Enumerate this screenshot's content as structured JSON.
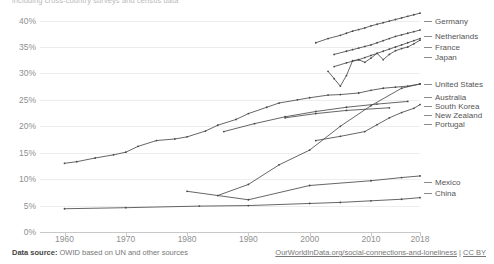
{
  "subtitle_fragment": "including cross-country surveys and census data",
  "footer": {
    "source_label": "Data source:",
    "source_text": " OWID based on UN and other sources",
    "credit_url": "OurWorldInData.org/social-connections-and-loneliness",
    "credit_license": "CC BY",
    "credit_separator": " | "
  },
  "chart_data": {
    "type": "line",
    "title": "",
    "xlabel": "",
    "ylabel": "",
    "xlim": [
      1956,
      2018
    ],
    "ylim": [
      0,
      42
    ],
    "grid": true,
    "legend_position": "right",
    "ytick_labels": [
      "0%",
      "5%",
      "10%",
      "15%",
      "20%",
      "25%",
      "30%",
      "35%",
      "40%"
    ],
    "ytick_values": [
      0,
      5,
      10,
      15,
      20,
      25,
      30,
      35,
      40
    ],
    "xtick_labels": [
      "1960",
      "1970",
      "1980",
      "1990",
      "2000",
      "2010",
      "2018"
    ],
    "xtick_values": [
      1960,
      1970,
      1980,
      1990,
      2000,
      2010,
      2018
    ],
    "series": [
      {
        "name": "Germany",
        "label_y": 17,
        "x": [
          2001,
          2003,
          2005,
          2006,
          2007,
          2008,
          2009,
          2010,
          2011,
          2012,
          2013,
          2014,
          2015,
          2016,
          2017,
          2018
        ],
        "values": [
          35.8,
          36.6,
          37.2,
          37.6,
          38.0,
          38.3,
          38.6,
          39.0,
          39.3,
          39.6,
          39.9,
          40.2,
          40.5,
          40.8,
          41.1,
          41.4
        ]
      },
      {
        "name": "Netherlands",
        "label_y": 32,
        "x": [
          2004,
          2006,
          2007,
          2008,
          2009,
          2010,
          2011,
          2012,
          2013,
          2014,
          2015,
          2016,
          2017,
          2018
        ],
        "values": [
          33.6,
          34.2,
          34.5,
          34.8,
          35.1,
          35.4,
          35.8,
          36.2,
          36.6,
          37.0,
          37.3,
          37.6,
          37.9,
          38.2
        ]
      },
      {
        "name": "France",
        "label_y": 43,
        "x": [
          2004,
          2006,
          2008,
          2009,
          2010,
          2011,
          2012,
          2013,
          2014,
          2015,
          2016,
          2017,
          2018
        ],
        "values": [
          31.3,
          32.0,
          32.6,
          33.0,
          33.4,
          33.8,
          34.2,
          34.6,
          35.0,
          35.4,
          35.8,
          36.2,
          36.6
        ]
      },
      {
        "name": "Japan",
        "label_y": 53,
        "x": [
          2003,
          2004,
          2005,
          2006,
          2007,
          2008,
          2009,
          2010,
          2011,
          2012,
          2013,
          2014,
          2015,
          2016,
          2017,
          2018
        ],
        "values": [
          30.4,
          29.0,
          27.6,
          29.6,
          32.4,
          32.6,
          32.1,
          32.9,
          33.8,
          32.6,
          33.6,
          34.3,
          34.7,
          35.0,
          35.6,
          36.3
        ]
      },
      {
        "name": "United States",
        "label_y": 80,
        "x": [
          1960,
          1962,
          1965,
          1968,
          1970,
          1972,
          1975,
          1978,
          1980,
          1983,
          1985,
          1988,
          1990,
          1993,
          1995,
          1998,
          2000,
          2003,
          2005,
          2008,
          2010,
          2012,
          2014,
          2016,
          2018
        ],
        "values": [
          13.0,
          13.3,
          14.0,
          14.6,
          15.1,
          16.2,
          17.3,
          17.6,
          18.0,
          19.1,
          20.2,
          21.3,
          22.4,
          23.6,
          24.4,
          25.0,
          25.4,
          25.9,
          26.0,
          26.3,
          26.8,
          27.2,
          27.4,
          27.6,
          28.0
        ]
      },
      {
        "name": "Australia",
        "label_y": 93,
        "x": [
          1986,
          1991,
          1996,
          2001,
          2006,
          2011,
          2016
        ],
        "values": [
          19.0,
          20.5,
          21.8,
          22.8,
          23.6,
          24.2,
          24.7
        ]
      },
      {
        "name": "South Korea",
        "label_y": 102,
        "x": [
          1985,
          1990,
          1995,
          2000,
          2005,
          2010,
          2015,
          2018
        ],
        "values": [
          6.9,
          9.0,
          12.7,
          15.5,
          20.0,
          23.9,
          27.2,
          28.0
        ]
      },
      {
        "name": "New Zealand",
        "label_y": 111,
        "x": [
          1996,
          2001,
          2006,
          2013
        ],
        "values": [
          21.6,
          22.4,
          23.0,
          23.5
        ]
      },
      {
        "name": "Portugal",
        "label_y": 120,
        "x": [
          2001,
          2005,
          2009,
          2011,
          2013,
          2015,
          2017,
          2018
        ],
        "values": [
          17.3,
          18.1,
          19.0,
          20.3,
          21.6,
          22.6,
          23.4,
          24.1
        ]
      },
      {
        "name": "Mexico",
        "label_y": 178,
        "x": [
          1980,
          1990,
          2000,
          2010,
          2015,
          2018
        ],
        "values": [
          7.7,
          6.1,
          8.8,
          9.7,
          10.3,
          10.6
        ]
      },
      {
        "name": "China",
        "label_y": 189,
        "x": [
          1960,
          1970,
          1982,
          1990,
          2000,
          2005,
          2010,
          2015,
          2018
        ],
        "values": [
          4.4,
          4.6,
          4.9,
          5.0,
          5.4,
          5.6,
          5.9,
          6.2,
          6.5
        ]
      }
    ]
  }
}
